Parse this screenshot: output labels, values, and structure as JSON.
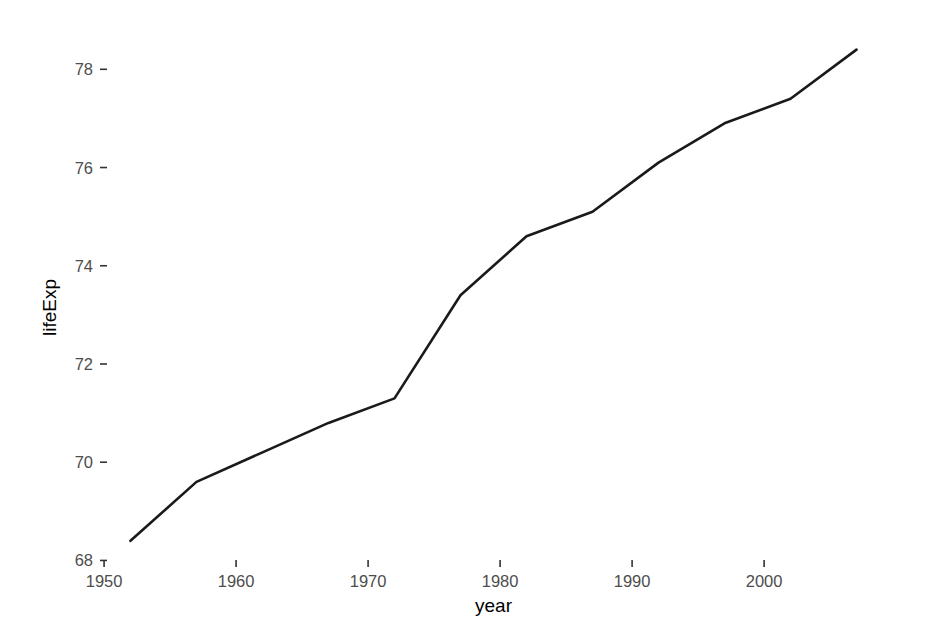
{
  "chart_data": {
    "type": "line",
    "title": "",
    "subtitle": "",
    "xlabel": "year",
    "ylabel": "lifeExp",
    "x": [
      1952,
      1957,
      1962,
      1967,
      1972,
      1977,
      1982,
      1987,
      1992,
      1997,
      2002,
      2007
    ],
    "values": [
      68.4,
      69.6,
      70.2,
      70.8,
      71.3,
      73.4,
      74.6,
      75.1,
      76.1,
      76.9,
      77.4,
      78.4
    ],
    "series": [
      {
        "name": "lifeExp",
        "values": [
          68.4,
          69.6,
          70.2,
          70.8,
          71.3,
          73.4,
          74.6,
          75.1,
          76.1,
          76.9,
          77.4,
          78.4
        ]
      }
    ],
    "xlim": [
      1950.6,
      2008.4
    ],
    "ylim": [
      67.5,
      78.8
    ],
    "x_ticks": [
      1950,
      1960,
      1970,
      1980,
      1990,
      2000
    ],
    "x_tick_labels": [
      "1950",
      "1960",
      "1970",
      "1980",
      "1990",
      "2000"
    ],
    "y_ticks": [
      68,
      70,
      72,
      74,
      76,
      78
    ],
    "y_tick_labels": [
      "68",
      "70",
      "72",
      "74",
      "76",
      "78"
    ],
    "grid": false,
    "legend": "none",
    "line_color": "#1a1a1a",
    "background_color": "#ffffff",
    "tick_label_color": "#4d4d4d",
    "axis_title_color": "#000000"
  },
  "axes": {
    "x_title": "year",
    "y_title": "lifeExp"
  }
}
